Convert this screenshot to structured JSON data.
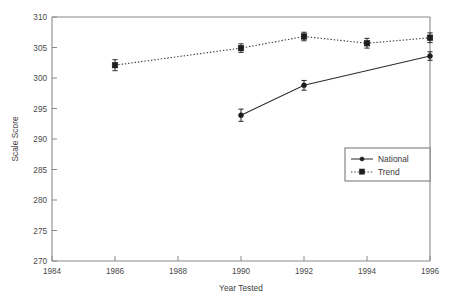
{
  "chart_data": {
    "type": "line",
    "title": "",
    "xlabel": "Year Tested",
    "ylabel": "Scale Score",
    "xlim": [
      1984,
      1996
    ],
    "ylim": [
      270,
      310
    ],
    "xticks": [
      1984,
      1986,
      1988,
      1990,
      1992,
      1994,
      1996
    ],
    "yticks": [
      270,
      275,
      280,
      285,
      290,
      295,
      300,
      305,
      310
    ],
    "grid": false,
    "legend_position": "lower-right",
    "error_bars": true,
    "series": [
      {
        "name": "National",
        "marker": "circle",
        "linestyle": "solid",
        "color": "#1d1d1d",
        "x": [
          1990,
          1992,
          1996
        ],
        "values": [
          293.9,
          298.8,
          303.6
        ],
        "errors": [
          1.0,
          0.8,
          0.7
        ]
      },
      {
        "name": "Trend",
        "marker": "square",
        "linestyle": "dotted",
        "color": "#1d1d1d",
        "x": [
          1986,
          1990,
          1992,
          1994,
          1996
        ],
        "values": [
          302.1,
          304.9,
          306.8,
          305.7,
          306.6
        ],
        "errors": [
          0.9,
          0.7,
          0.7,
          0.8,
          0.8
        ]
      }
    ]
  },
  "axes": {
    "y_label": "Scale Score",
    "x_label": "Year Tested",
    "y_tick_labels": [
      "310",
      "305",
      "300",
      "295",
      "290",
      "285",
      "280",
      "275",
      "270"
    ],
    "x_tick_labels": [
      "1984",
      "1986",
      "1988",
      "1990",
      "1992",
      "1994",
      "1996"
    ]
  },
  "legend": {
    "entries": [
      {
        "label": "National"
      },
      {
        "label": "Trend"
      }
    ]
  }
}
